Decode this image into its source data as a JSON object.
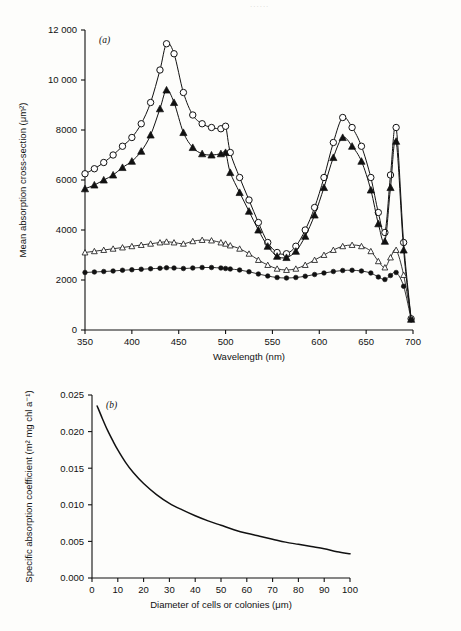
{
  "page": {
    "header_ghost": "......"
  },
  "chart_data": [
    {
      "id": "panel-a",
      "type": "line",
      "panel_label": "(a)",
      "title": "",
      "xlabel": "Wavelength (nm)",
      "ylabel": "Mean absorption cross-section (μm²)",
      "xlim": [
        350,
        700
      ],
      "ylim": [
        0,
        12000
      ],
      "xticks": [
        350,
        400,
        450,
        500,
        550,
        600,
        650,
        700
      ],
      "xticklabels": [
        "350",
        "400",
        "450",
        "500",
        "550",
        "600",
        "650",
        "700"
      ],
      "yticks": [
        0,
        2000,
        4000,
        6000,
        8000,
        10000,
        12000
      ],
      "yticklabels": [
        "0",
        "2000",
        "4000",
        "6000",
        "8000",
        "10 000",
        "12 000"
      ],
      "grid": false,
      "legend": "none",
      "series": [
        {
          "name": "large cells open circle",
          "marker": "open-circle",
          "x": [
            350,
            360,
            370,
            380,
            390,
            400,
            410,
            420,
            430,
            437,
            445,
            455,
            465,
            475,
            485,
            495,
            500,
            505,
            515,
            525,
            535,
            545,
            555,
            565,
            575,
            585,
            595,
            605,
            615,
            625,
            635,
            645,
            655,
            663,
            670,
            676,
            682,
            690,
            698
          ],
          "y": [
            6250,
            6450,
            6700,
            7000,
            7350,
            7700,
            8250,
            9100,
            10400,
            11450,
            11050,
            9500,
            8600,
            8250,
            8100,
            8050,
            8150,
            7100,
            6100,
            5200,
            4300,
            3500,
            3100,
            3050,
            3350,
            4000,
            4900,
            6100,
            7500,
            8500,
            8100,
            7350,
            6100,
            4700,
            3900,
            6200,
            8100,
            3500,
            450
          ]
        },
        {
          "name": "large cells filled triangle",
          "marker": "filled-triangle",
          "x": [
            350,
            360,
            370,
            380,
            390,
            400,
            410,
            420,
            430,
            437,
            445,
            455,
            465,
            475,
            485,
            495,
            500,
            505,
            515,
            525,
            535,
            545,
            555,
            565,
            575,
            585,
            595,
            605,
            615,
            625,
            635,
            645,
            655,
            663,
            670,
            676,
            682,
            690,
            698
          ],
          "y": [
            5650,
            5800,
            6000,
            6200,
            6500,
            6750,
            7150,
            7800,
            8850,
            9600,
            9100,
            7900,
            7300,
            7050,
            7000,
            7050,
            7100,
            6300,
            5500,
            4750,
            4000,
            3350,
            2950,
            2900,
            3150,
            3750,
            4600,
            5700,
            6900,
            7700,
            7350,
            6750,
            5600,
            4250,
            3550,
            5700,
            7550,
            3200,
            430
          ]
        },
        {
          "name": "small cells open triangle",
          "marker": "open-triangle",
          "x": [
            350,
            360,
            370,
            380,
            390,
            400,
            410,
            420,
            430,
            437,
            445,
            455,
            465,
            475,
            485,
            495,
            500,
            505,
            515,
            525,
            535,
            545,
            555,
            565,
            575,
            585,
            595,
            605,
            615,
            625,
            635,
            645,
            655,
            663,
            670,
            676,
            682,
            690,
            698
          ],
          "y": [
            3100,
            3150,
            3200,
            3250,
            3300,
            3350,
            3400,
            3450,
            3500,
            3530,
            3500,
            3450,
            3550,
            3600,
            3580,
            3500,
            3450,
            3380,
            3250,
            3050,
            2800,
            2600,
            2450,
            2400,
            2450,
            2600,
            2800,
            3000,
            3200,
            3350,
            3400,
            3350,
            3150,
            2750,
            2500,
            2900,
            3200,
            2200,
            480
          ]
        },
        {
          "name": "small cells filled circle",
          "marker": "filled-circle",
          "x": [
            350,
            360,
            370,
            380,
            390,
            400,
            410,
            420,
            430,
            437,
            445,
            455,
            465,
            475,
            485,
            495,
            500,
            505,
            515,
            525,
            535,
            545,
            555,
            565,
            575,
            585,
            595,
            605,
            615,
            625,
            635,
            645,
            655,
            663,
            670,
            676,
            682,
            690,
            698
          ],
          "y": [
            2300,
            2320,
            2340,
            2360,
            2390,
            2410,
            2430,
            2450,
            2470,
            2490,
            2480,
            2460,
            2480,
            2500,
            2500,
            2480,
            2460,
            2440,
            2400,
            2330,
            2240,
            2160,
            2100,
            2080,
            2100,
            2150,
            2220,
            2280,
            2340,
            2380,
            2390,
            2360,
            2280,
            2120,
            2020,
            2180,
            2300,
            1750,
            420
          ]
        }
      ]
    },
    {
      "id": "panel-b",
      "type": "line",
      "panel_label": "(b)",
      "title": "",
      "xlabel": "Diameter of cells or colonies (μm)",
      "ylabel": "Specific absorption coefficient (m² mg chl a⁻¹)",
      "xlim": [
        0,
        100
      ],
      "ylim": [
        0.0,
        0.025
      ],
      "xticks": [
        0,
        10,
        20,
        30,
        40,
        50,
        60,
        70,
        80,
        90,
        100
      ],
      "xticklabels": [
        "0",
        "10",
        "20",
        "30",
        "40",
        "50",
        "60",
        "70",
        "80",
        "90",
        "100"
      ],
      "yticks": [
        0.0,
        0.005,
        0.01,
        0.015,
        0.02,
        0.025
      ],
      "yticklabels": [
        "0.000",
        "0.005",
        "0.010",
        "0.015",
        "0.020",
        "0.025"
      ],
      "grid": false,
      "legend": "none",
      "series": [
        {
          "name": "specific absorption coefficient",
          "marker": "none",
          "x": [
            2,
            4,
            6,
            8,
            10,
            13,
            16,
            20,
            25,
            30,
            35,
            40,
            45,
            50,
            55,
            60,
            65,
            70,
            75,
            80,
            85,
            90,
            95,
            100
          ],
          "y": [
            0.0235,
            0.0218,
            0.0202,
            0.0188,
            0.0175,
            0.0158,
            0.0144,
            0.0129,
            0.0114,
            0.0102,
            0.0093,
            0.0085,
            0.0078,
            0.0072,
            0.0066,
            0.0061,
            0.0057,
            0.0053,
            0.0049,
            0.0046,
            0.0043,
            0.004,
            0.0036,
            0.0033
          ]
        }
      ]
    }
  ]
}
